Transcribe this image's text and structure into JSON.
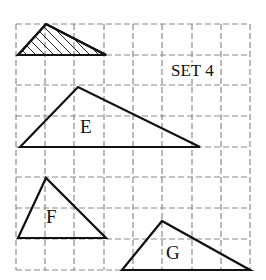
{
  "set_label": "SET 4",
  "colors": {
    "line": "#111111",
    "grid": "#8a8a8a",
    "background": "#ffffff"
  },
  "grid": {
    "style": "dashed",
    "x_lines": [
      16,
      45,
      74,
      104,
      133,
      162,
      192,
      221,
      250
    ],
    "y_lines": [
      24,
      55,
      85,
      116,
      147,
      177,
      208,
      239,
      270
    ]
  },
  "shapes": [
    {
      "id": "example",
      "label": "",
      "hatched": true,
      "vertices": [
        [
          18,
          55
        ],
        [
          46,
          24
        ],
        [
          106,
          55
        ]
      ]
    },
    {
      "id": "E",
      "label": "E",
      "hatched": false,
      "vertices": [
        [
          20,
          147
        ],
        [
          78,
          87
        ],
        [
          200,
          147
        ]
      ]
    },
    {
      "id": "F",
      "label": "F",
      "hatched": false,
      "vertices": [
        [
          18,
          238
        ],
        [
          46,
          178
        ],
        [
          106,
          238
        ]
      ]
    },
    {
      "id": "G",
      "label": "G",
      "hatched": false,
      "vertices": [
        [
          122,
          270
        ],
        [
          162,
          221
        ],
        [
          250,
          270
        ]
      ]
    }
  ],
  "labels": {
    "e": "E",
    "f": "F",
    "g": "G"
  }
}
